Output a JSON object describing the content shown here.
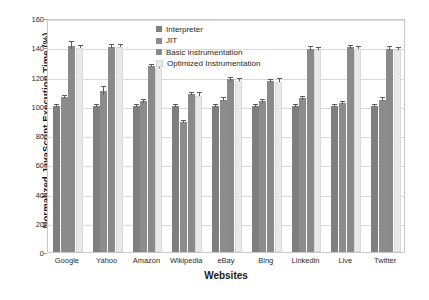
{
  "chart_data": {
    "type": "bar",
    "title": "",
    "xlabel": "Websites",
    "ylabel": "Normalized JavaScript Execution Time (%)",
    "ylim": [
      0,
      160
    ],
    "yticks": [
      0,
      20,
      40,
      60,
      80,
      100,
      120,
      140,
      160
    ],
    "grid": true,
    "legend_position": "top-center",
    "categories": [
      "Google",
      "Yahoo",
      "Amazon",
      "Wikipedia",
      "eBay",
      "Bing",
      "Linkedin",
      "Live",
      "Twitter"
    ],
    "series": [
      {
        "name": "Interpreter",
        "color": "#7f7f7f",
        "values": [
          100,
          100,
          100,
          100,
          100,
          100,
          100,
          100,
          100
        ],
        "errors": [
          0.6,
          0.6,
          0.8,
          0.8,
          0.8,
          0.8,
          0.8,
          0.8,
          0.8
        ]
      },
      {
        "name": "JIT",
        "color": "#8c8c8c",
        "values": [
          106,
          110,
          103,
          89,
          104,
          103,
          105,
          102,
          104
        ],
        "errors": [
          0.8,
          2.5,
          1.0,
          0.8,
          1.0,
          0.8,
          1.2,
          0.8,
          1.0
        ]
      },
      {
        "name": "Basic instrumentation",
        "color": "#8a8a8a",
        "values": [
          141,
          140.5,
          127,
          108,
          118,
          117,
          139,
          140,
          139
        ],
        "errors": [
          2.5,
          1.0,
          0.8,
          0.8,
          0.8,
          0.8,
          1.0,
          1.2,
          1.0
        ]
      },
      {
        "name": "Optimized Instrumentation",
        "color": "#e9e9e9",
        "values": [
          139.5,
          140,
          126,
          107,
          117,
          116.5,
          138,
          139,
          138
        ],
        "errors": [
          0.8,
          0.8,
          0.8,
          0.8,
          0.8,
          0.8,
          0.8,
          0.8,
          0.8
        ]
      }
    ]
  }
}
